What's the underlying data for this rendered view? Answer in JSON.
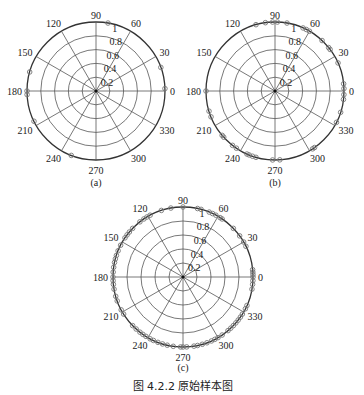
{
  "figure_caption": "图 4.2.2   原始样本图",
  "chart_data": [
    {
      "type": "scatter",
      "subtype": "polar",
      "panel_label": "(a)",
      "title": "",
      "angle_ticks": [
        0,
        30,
        60,
        90,
        120,
        150,
        180,
        210,
        240,
        270,
        300,
        330
      ],
      "radial_ticks": [
        0.2,
        0.4,
        0.6,
        0.8,
        1
      ],
      "radial_range": [
        0,
        1
      ],
      "grid": true,
      "points": [
        {
          "theta": 80,
          "r": 1
        },
        {
          "theta": 20,
          "r": 1
        },
        {
          "theta": 2,
          "r": 1
        },
        {
          "theta": 164,
          "r": 1
        },
        {
          "theta": 180,
          "r": 1
        },
        {
          "theta": 183,
          "r": 1
        },
        {
          "theta": 206,
          "r": 1
        },
        {
          "theta": 249,
          "r": 1
        }
      ]
    },
    {
      "type": "scatter",
      "subtype": "polar",
      "panel_label": "(b)",
      "title": "",
      "angle_ticks": [
        0,
        30,
        60,
        90,
        120,
        150,
        180,
        210,
        240,
        270,
        300,
        330
      ],
      "radial_ticks": [
        0.2,
        0.4,
        0.6,
        0.8,
        1
      ],
      "radial_range": [
        0,
        1
      ],
      "grid": true,
      "points": [
        {
          "theta": 106,
          "r": 1
        },
        {
          "theta": 98,
          "r": 1
        },
        {
          "theta": 92,
          "r": 1
        },
        {
          "theta": 88,
          "r": 1
        },
        {
          "theta": 80,
          "r": 1
        },
        {
          "theta": 66,
          "r": 1
        },
        {
          "theta": 63,
          "r": 1
        },
        {
          "theta": 60,
          "r": 1
        },
        {
          "theta": 47,
          "r": 1
        },
        {
          "theta": 39,
          "r": 1
        },
        {
          "theta": 37,
          "r": 1
        },
        {
          "theta": 24,
          "r": 1
        },
        {
          "theta": 6,
          "r": 1
        },
        {
          "theta": 2,
          "r": 1
        },
        {
          "theta": 357,
          "r": 1
        },
        {
          "theta": 353,
          "r": 1
        },
        {
          "theta": 342,
          "r": 1
        },
        {
          "theta": 333,
          "r": 1
        },
        {
          "theta": 305,
          "r": 1
        },
        {
          "theta": 303,
          "r": 1
        },
        {
          "theta": 274,
          "r": 1
        },
        {
          "theta": 268,
          "r": 1
        },
        {
          "theta": 254,
          "r": 1
        },
        {
          "theta": 251,
          "r": 1
        },
        {
          "theta": 248,
          "r": 1
        },
        {
          "theta": 246,
          "r": 1
        },
        {
          "theta": 236,
          "r": 1
        },
        {
          "theta": 232,
          "r": 1
        },
        {
          "theta": 222,
          "r": 1
        },
        {
          "theta": 220,
          "r": 1
        },
        {
          "theta": 202,
          "r": 1
        },
        {
          "theta": 197,
          "r": 1
        },
        {
          "theta": 180,
          "r": 1
        }
      ]
    },
    {
      "type": "scatter",
      "subtype": "polar",
      "panel_label": "(c)",
      "title": "",
      "angle_ticks": [
        0,
        30,
        60,
        90,
        120,
        150,
        180,
        210,
        240,
        270,
        300,
        330
      ],
      "radial_ticks": [
        0.2,
        0.4,
        0.6,
        0.8,
        1
      ],
      "radial_range": [
        0,
        1
      ],
      "grid": true,
      "points": [
        {
          "theta": 108,
          "r": 1
        },
        {
          "theta": 100,
          "r": 1
        },
        {
          "theta": 90,
          "r": 1
        },
        {
          "theta": 78,
          "r": 1
        },
        {
          "theta": 75,
          "r": 1
        },
        {
          "theta": 68,
          "r": 1
        },
        {
          "theta": 65,
          "r": 1
        },
        {
          "theta": 62,
          "r": 1
        },
        {
          "theta": 58,
          "r": 1
        },
        {
          "theta": 56,
          "r": 1
        },
        {
          "theta": 44,
          "r": 1
        },
        {
          "theta": 36,
          "r": 1
        },
        {
          "theta": 30,
          "r": 1
        },
        {
          "theta": 26,
          "r": 1
        },
        {
          "theta": 6,
          "r": 1
        },
        {
          "theta": 4,
          "r": 1
        },
        {
          "theta": 2,
          "r": 1
        },
        {
          "theta": 0,
          "r": 1
        },
        {
          "theta": 357,
          "r": 1
        },
        {
          "theta": 354,
          "r": 1
        },
        {
          "theta": 350,
          "r": 1
        },
        {
          "theta": 336,
          "r": 1
        },
        {
          "theta": 333,
          "r": 1
        },
        {
          "theta": 328,
          "r": 1
        },
        {
          "theta": 325,
          "r": 1
        },
        {
          "theta": 322,
          "r": 1
        },
        {
          "theta": 319,
          "r": 1
        },
        {
          "theta": 316,
          "r": 1
        },
        {
          "theta": 313,
          "r": 1
        },
        {
          "theta": 310,
          "r": 1
        },
        {
          "theta": 304,
          "r": 1
        },
        {
          "theta": 300,
          "r": 1
        },
        {
          "theta": 297,
          "r": 1
        },
        {
          "theta": 294,
          "r": 1
        },
        {
          "theta": 290,
          "r": 1
        },
        {
          "theta": 286,
          "r": 1
        },
        {
          "theta": 282,
          "r": 1
        },
        {
          "theta": 279,
          "r": 1
        },
        {
          "theta": 273,
          "r": 1
        },
        {
          "theta": 270,
          "r": 1
        },
        {
          "theta": 268,
          "r": 1
        },
        {
          "theta": 262,
          "r": 1
        },
        {
          "theta": 257,
          "r": 1
        },
        {
          "theta": 253,
          "r": 1
        },
        {
          "theta": 249,
          "r": 1
        },
        {
          "theta": 245,
          "r": 1
        },
        {
          "theta": 242,
          "r": 1
        },
        {
          "theta": 238,
          "r": 1
        },
        {
          "theta": 235,
          "r": 1
        },
        {
          "theta": 232,
          "r": 1
        },
        {
          "theta": 228,
          "r": 1
        },
        {
          "theta": 224,
          "r": 1
        },
        {
          "theta": 212,
          "r": 1
        },
        {
          "theta": 208,
          "r": 1
        },
        {
          "theta": 200,
          "r": 1
        },
        {
          "theta": 196,
          "r": 1
        },
        {
          "theta": 190,
          "r": 1
        },
        {
          "theta": 186,
          "r": 1
        },
        {
          "theta": 183,
          "r": 1
        },
        {
          "theta": 180,
          "r": 1
        },
        {
          "theta": 176,
          "r": 1
        },
        {
          "theta": 172,
          "r": 1
        },
        {
          "theta": 168,
          "r": 1
        },
        {
          "theta": 165,
          "r": 1
        },
        {
          "theta": 162,
          "r": 1
        },
        {
          "theta": 158,
          "r": 1
        },
        {
          "theta": 153,
          "r": 1
        },
        {
          "theta": 146,
          "r": 1
        },
        {
          "theta": 143,
          "r": 1
        },
        {
          "theta": 140,
          "r": 1
        },
        {
          "theta": 136,
          "r": 1
        },
        {
          "theta": 128,
          "r": 1
        },
        {
          "theta": 124,
          "r": 1
        },
        {
          "theta": 121,
          "r": 1
        },
        {
          "theta": 118,
          "r": 1
        }
      ]
    }
  ]
}
